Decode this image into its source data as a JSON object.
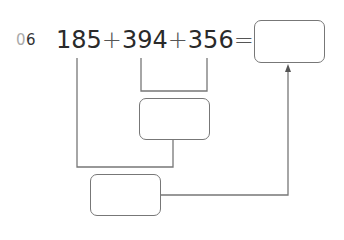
{
  "problem": {
    "number_prefix": "0",
    "number_digit": "6",
    "terms": [
      "185",
      "394",
      "356"
    ],
    "operator": "+",
    "equals": "=",
    "answer_box": "",
    "intermediate_box_1": "",
    "intermediate_box_2": ""
  },
  "colors": {
    "text": "#2a2a2a",
    "line": "#777777",
    "number_prefix": "#aaaaaa"
  }
}
